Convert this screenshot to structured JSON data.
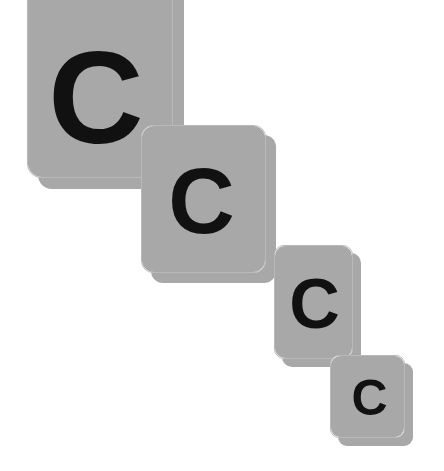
{
  "scene": {
    "title": "Cascading lettered cards",
    "background_color": "#ffffff",
    "card_fill_color": "#ffffff",
    "card_border_color": "#b9b9b9",
    "card_shadow_color": "#a8a8a8",
    "letter_color": "#111111",
    "card_count": 4
  },
  "cards": [
    {
      "letter": "C",
      "name": "card-1",
      "x": 27,
      "y": -30,
      "width": 146,
      "height": 208,
      "radius": 14,
      "font_size": 132,
      "shadow_offset": 11,
      "letter_offset_x": -4,
      "letter_offset_y": 24
    },
    {
      "letter": "C",
      "name": "card-2",
      "x": 141,
      "y": 125,
      "width": 125,
      "height": 148,
      "radius": 12,
      "font_size": 92,
      "shadow_offset": 10,
      "letter_offset_x": -2,
      "letter_offset_y": 2
    },
    {
      "letter": "C",
      "name": "card-3",
      "x": 274,
      "y": 245,
      "width": 79,
      "height": 114,
      "radius": 10,
      "font_size": 70,
      "shadow_offset": 8,
      "letter_offset_x": 1,
      "letter_offset_y": 2
    },
    {
      "letter": "C",
      "name": "card-4",
      "x": 330,
      "y": 355,
      "width": 75,
      "height": 83,
      "radius": 9,
      "font_size": 50,
      "shadow_offset": 8,
      "letter_offset_x": 2,
      "letter_offset_y": 1
    }
  ]
}
